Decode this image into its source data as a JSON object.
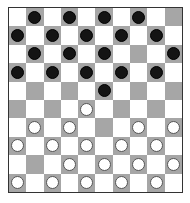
{
  "board": {
    "size": 10,
    "colors": {
      "dark_square": "#a6a6a6",
      "light_square": "#ffffff",
      "black_piece": "#141414",
      "white_piece": "#ffffff"
    },
    "rows": [
      "-b-b-b-b--",
      "b-b-b-b-b-",
      "-b-b-b---b",
      "b-b-b-b-b-",
      "-----b----",
      "----w-----",
      "-w-w---w-w",
      "w-w-w-w-w-",
      "---w-w-w-w",
      "w-w-w-w-w-"
    ],
    "legend": {
      "b": "black-piece",
      "w": "white-piece",
      "-": "empty"
    }
  }
}
